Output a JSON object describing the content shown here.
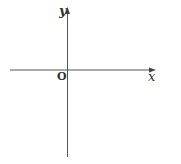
{
  "diagram": {
    "type": "coordinate-axes",
    "labels": {
      "y_axis": "y",
      "x_axis": "x",
      "origin": "O"
    },
    "colors": {
      "axis_line": "#555555",
      "label": "#333333",
      "background": "#ffffff"
    }
  }
}
